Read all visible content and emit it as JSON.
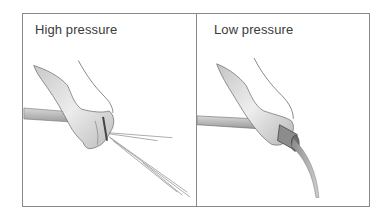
{
  "panels": [
    {
      "label": "High pressure",
      "illustration": "hand-pinching-hose-spray"
    },
    {
      "label": "Low pressure",
      "illustration": "hand-holding-hose-stream"
    }
  ]
}
